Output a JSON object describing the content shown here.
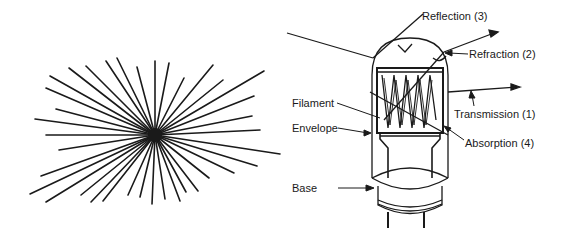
{
  "left_figure": {
    "name": "starburst",
    "description": "Point light source radiating lines in all directions",
    "center": [
      155,
      135
    ]
  },
  "right_figure": {
    "name": "lamp-light-interaction-diagram",
    "labels": {
      "reflection": "Reflection (3)",
      "refraction": "Refraction (2)",
      "transmission": "Transmission (1)",
      "absorption": "Absorption (4)",
      "filament": "Filament",
      "envelope": "Envelope",
      "base": "Base"
    }
  },
  "colors": {
    "ink": "#1a1a1a",
    "background": "#ffffff"
  }
}
